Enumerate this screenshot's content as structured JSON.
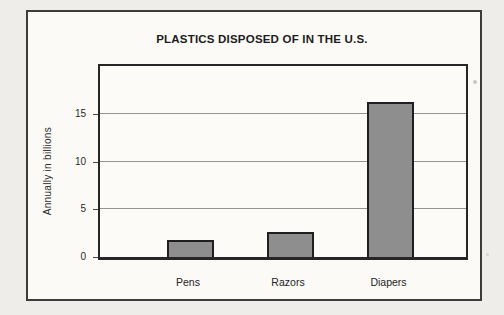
{
  "chart_data": {
    "type": "bar",
    "title": "PLASTICS DISPOSED OF IN THE U.S.",
    "ylabel": "Annually in billions",
    "xlabel": "",
    "categories": [
      "Pens",
      "Razors",
      "Diapers"
    ],
    "values": [
      1.8,
      2.6,
      16.2
    ],
    "yticks": [
      0,
      5,
      10,
      15
    ],
    "ylim": [
      0,
      20
    ],
    "grid": true,
    "legend": false,
    "gridline_color": "#949494",
    "bar_fill": "#8e8e8e",
    "bar_border": "#1f1f1f"
  }
}
